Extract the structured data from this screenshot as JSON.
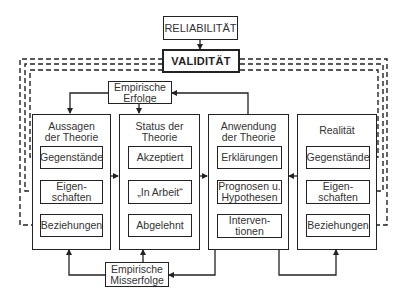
{
  "top": {
    "reliability": "RELIABILITÄT",
    "validity": "VALIDITÄT"
  },
  "feedback": {
    "successes": "Empirische\nErfolge",
    "failures": "Empirische\nMisserfolge"
  },
  "columns": [
    {
      "title": "Aussagen\nder Theorie",
      "items": [
        "Gegenstände",
        "Eigen-\nschaften",
        "Beziehungen"
      ]
    },
    {
      "title": "Status der\nTheorie",
      "items": [
        "Akzeptiert",
        "„In Arbeit“",
        "Abgelehnt"
      ]
    },
    {
      "title": "Anwendung\nder Theorie",
      "items": [
        "Erklärungen",
        "Prognosen u.\nHypothesen",
        "Interven-\ntionen"
      ]
    },
    {
      "title": "Realität",
      "items": [
        "Gegenstände",
        "Eigen-\nschaften",
        "Beziehungen"
      ]
    }
  ],
  "colors": {
    "line": "#222222",
    "text": "#333333",
    "background": "#ffffff"
  }
}
